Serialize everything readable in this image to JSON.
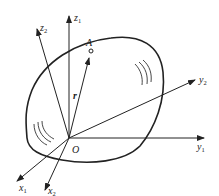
{
  "diagram": {
    "origin": {
      "label": "O"
    },
    "point": {
      "label": "A"
    },
    "vector": {
      "label": "r"
    },
    "axes": {
      "z1": {
        "base": "z",
        "sub": "1"
      },
      "z2": {
        "base": "z",
        "sub": "2"
      },
      "y1": {
        "base": "y",
        "sub": "1"
      },
      "y2": {
        "base": "y",
        "sub": "2"
      },
      "x1": {
        "base": "x",
        "sub": "1"
      },
      "x2": {
        "base": "x",
        "sub": "2"
      }
    },
    "colors": {
      "stroke": "#222222",
      "background": "#ffffff"
    }
  }
}
